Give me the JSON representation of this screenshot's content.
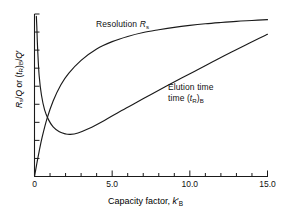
{
  "chart_data": {
    "type": "line",
    "title": "",
    "xlabel": "Capacity factor, k'B",
    "ylabel": "Rs/Q or (tR)B/Q'",
    "xlim": [
      0,
      15
    ],
    "ylim": [
      0,
      1
    ],
    "grid": false,
    "legend_position": "inline-annotations",
    "xticks": [
      0,
      5,
      10,
      15
    ],
    "xtick_labels": [
      "0",
      "5.0",
      "10.0",
      "15.0"
    ],
    "ytick_count": 9,
    "ytick_labels": [],
    "series": [
      {
        "name": "Resolution Rs",
        "label": "Resolution",
        "symbol": "Rs",
        "x": [
          0.0,
          0.15,
          0.3,
          0.5,
          0.8,
          1.2,
          1.7,
          2.2,
          3.0,
          4.0,
          5.0,
          6.0,
          7.0,
          8.0,
          9.0,
          10.0,
          11.0,
          12.0,
          13.0,
          14.0,
          15.0
        ],
        "y": [
          0.0,
          0.08,
          0.155,
          0.245,
          0.355,
          0.465,
          0.565,
          0.635,
          0.715,
          0.785,
          0.83,
          0.862,
          0.886,
          0.903,
          0.918,
          0.93,
          0.94,
          0.948,
          0.955,
          0.96,
          0.965
        ]
      },
      {
        "name": "Elution time (tR)B",
        "label": "Elution time",
        "symbol": "(tR)B",
        "x": [
          0.12,
          0.15,
          0.2,
          0.3,
          0.45,
          0.65,
          0.9,
          1.2,
          1.6,
          2.0,
          2.3,
          2.8,
          3.5,
          4.5,
          5.5,
          6.5,
          7.5,
          8.5,
          9.5,
          10.5,
          11.5,
          12.5,
          13.5,
          14.5,
          15.0
        ],
        "y": [
          0.985,
          0.92,
          0.79,
          0.62,
          0.5,
          0.41,
          0.35,
          0.305,
          0.275,
          0.262,
          0.259,
          0.268,
          0.295,
          0.345,
          0.4,
          0.452,
          0.505,
          0.557,
          0.608,
          0.657,
          0.707,
          0.757,
          0.805,
          0.852,
          0.875
        ]
      }
    ],
    "annotations": [
      {
        "text": "Resolution",
        "symbol": "Rs",
        "x_px": 96,
        "y_px": 24
      },
      {
        "text": "Elution",
        "x_px": 168,
        "y_px": 87
      },
      {
        "text": "time",
        "symbol": "(tR)B",
        "x_px": 168,
        "y_px": 98
      }
    ],
    "colors": {
      "line": "#1a1a1a",
      "axis": "#1a1a1a",
      "background": "#ffffff"
    }
  }
}
